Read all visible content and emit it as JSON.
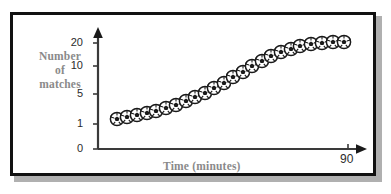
{
  "figure": {
    "border_color": "#111111",
    "shadow_color": "#b0b0b0",
    "background": "#ffffff"
  },
  "chart_data": {
    "type": "scatter",
    "title": "",
    "xlabel": "Time (minutes)",
    "ylabel": "Number of matches",
    "ylabel_lines": [
      "Number",
      "of",
      "matches"
    ],
    "label_color": "#8a8a8a",
    "marker": "soccer-ball",
    "grid": false,
    "legend": null,
    "axis_color": "#3a3a3a",
    "y_axis_scale": "non-linear",
    "y_ticks": [
      0,
      1,
      5,
      10,
      20
    ],
    "y_tick_labels": [
      "0",
      "1",
      "5",
      "10",
      "20"
    ],
    "x_ticks": [
      90
    ],
    "x_tick_labels": [
      "90"
    ],
    "xlim": [
      0,
      100
    ],
    "ylim_labels": [
      "0",
      "20"
    ],
    "points": [
      {
        "x": 8,
        "y": 1.0
      },
      {
        "x": 12,
        "y": 1.1
      },
      {
        "x": 16,
        "y": 1.3
      },
      {
        "x": 20,
        "y": 1.5
      },
      {
        "x": 24,
        "y": 1.8
      },
      {
        "x": 28,
        "y": 2.1
      },
      {
        "x": 32,
        "y": 2.5
      },
      {
        "x": 36,
        "y": 3.0
      },
      {
        "x": 40,
        "y": 3.6
      },
      {
        "x": 44,
        "y": 4.3
      },
      {
        "x": 48,
        "y": 5.2
      },
      {
        "x": 52,
        "y": 6.3
      },
      {
        "x": 56,
        "y": 7.5
      },
      {
        "x": 60,
        "y": 9.0
      },
      {
        "x": 64,
        "y": 10.5
      },
      {
        "x": 68,
        "y": 12.2
      },
      {
        "x": 72,
        "y": 13.8
      },
      {
        "x": 76,
        "y": 15.2
      },
      {
        "x": 80,
        "y": 16.5
      },
      {
        "x": 84,
        "y": 17.6
      },
      {
        "x": 87,
        "y": 18.5
      },
      {
        "x": 90,
        "y": 19.2
      },
      {
        "x": 93,
        "y": 19.8
      }
    ],
    "marker_pixels": [
      {
        "cx": 117,
        "cy": 119
      },
      {
        "cx": 127,
        "cy": 117
      },
      {
        "cx": 137,
        "cy": 115
      },
      {
        "cx": 147,
        "cy": 113
      },
      {
        "cx": 156,
        "cy": 111
      },
      {
        "cx": 166,
        "cy": 108
      },
      {
        "cx": 176,
        "cy": 105
      },
      {
        "cx": 186,
        "cy": 101
      },
      {
        "cx": 195,
        "cy": 97
      },
      {
        "cx": 205,
        "cy": 93
      },
      {
        "cx": 214,
        "cy": 88
      },
      {
        "cx": 224,
        "cy": 83
      },
      {
        "cx": 233,
        "cy": 77
      },
      {
        "cx": 243,
        "cy": 72
      },
      {
        "cx": 252,
        "cy": 66
      },
      {
        "cx": 262,
        "cy": 61
      },
      {
        "cx": 271,
        "cy": 56
      },
      {
        "cx": 281,
        "cy": 52
      },
      {
        "cx": 291,
        "cy": 49
      },
      {
        "cx": 300,
        "cy": 46
      },
      {
        "cx": 311,
        "cy": 44
      },
      {
        "cx": 322,
        "cy": 43
      },
      {
        "cx": 333,
        "cy": 42
      },
      {
        "cx": 344,
        "cy": 42
      }
    ]
  }
}
